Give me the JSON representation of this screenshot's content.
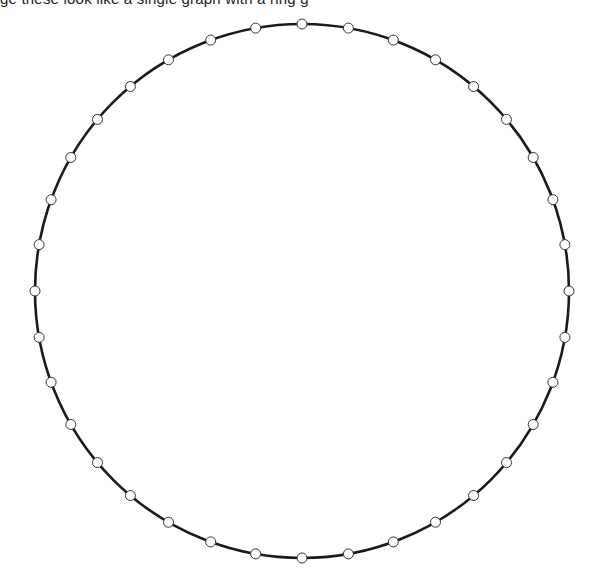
{
  "caption": {
    "text": "ge these look like a single graph with a ring g",
    "clipped": true
  },
  "diagram": {
    "type": "ring-graph",
    "center": {
      "x": 302,
      "y": 291
    },
    "radius": 267,
    "node_count": 36,
    "node_radius": 5,
    "edge_color": "#1a1a1a",
    "edge_width": 2.6,
    "node_fill": "#ffffff",
    "node_stroke": "#333333",
    "node_stroke_width": 1
  }
}
